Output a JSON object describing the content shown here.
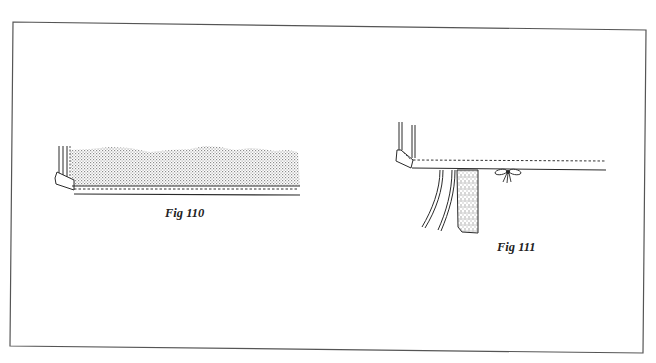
{
  "figures": [
    {
      "id": "fig110",
      "caption": "Fig 110",
      "description": "Curtain panel with stippled fabric, side hem and stitched bottom hem (dashed stitch line)"
    },
    {
      "id": "fig111",
      "caption": "Fig 111",
      "description": "Hem edge with hanging tape/strings and a tied bow beneath"
    }
  ],
  "colors": {
    "line": "#2a2a2a",
    "stipple": "#9a9a9a",
    "frame": "#555555",
    "background": "#ffffff"
  }
}
